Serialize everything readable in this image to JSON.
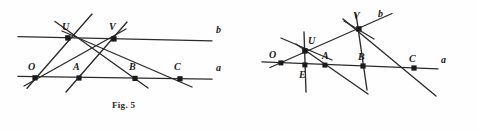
{
  "sheet": {
    "background_color": "#fefefe",
    "ink_color": "#2b2b2b"
  },
  "figures": [
    {
      "id": "fig5",
      "caption": "Fig. 5",
      "line_labels": [
        {
          "name": "b",
          "text": "b",
          "x": 216,
          "y": 25
        },
        {
          "name": "a",
          "text": "a",
          "x": 216,
          "y": 63
        }
      ],
      "points": [
        {
          "name": "U",
          "text": "U",
          "x": 68,
          "y": 38,
          "label_x": 62,
          "label_y": 22
        },
        {
          "name": "V",
          "text": "V",
          "x": 114,
          "y": 39,
          "label_x": 109,
          "label_y": 22
        },
        {
          "name": "O",
          "text": "O",
          "x": 35,
          "y": 78,
          "label_x": 28,
          "label_y": 62
        },
        {
          "name": "A",
          "text": "A",
          "x": 79,
          "y": 78,
          "label_x": 73,
          "label_y": 62
        },
        {
          "name": "B",
          "text": "B",
          "x": 135,
          "y": 78,
          "label_x": 129,
          "label_y": 62
        },
        {
          "name": "C",
          "text": "C",
          "x": 180,
          "y": 78,
          "label_x": 174,
          "label_y": 62
        }
      ]
    },
    {
      "id": "fig6",
      "caption": "Fig. 6",
      "line_labels": [
        {
          "name": "b",
          "text": "b",
          "x": 138,
          "y": 9
        },
        {
          "name": "a",
          "text": "a",
          "x": 201,
          "y": 55
        }
      ],
      "points": [
        {
          "name": "V",
          "text": "V",
          "x": 119,
          "y": 29,
          "label_x": 113,
          "label_y": 11
        },
        {
          "name": "U",
          "text": "U",
          "x": 65,
          "y": 51,
          "label_x": 68,
          "label_y": 36
        },
        {
          "name": "O",
          "text": "O",
          "x": 41,
          "y": 63,
          "label_x": 29,
          "label_y": 50
        },
        {
          "name": "E",
          "text": "E",
          "x": 65,
          "y": 65,
          "label_x": 59,
          "label_y": 70
        },
        {
          "name": "A",
          "text": "A",
          "x": 85,
          "y": 65,
          "label_x": 82,
          "label_y": 51
        },
        {
          "name": "B",
          "text": "B",
          "x": 123,
          "y": 66,
          "label_x": 118,
          "label_y": 52
        },
        {
          "name": "C",
          "text": "C",
          "x": 174,
          "y": 68,
          "label_x": 169,
          "label_y": 54
        }
      ]
    }
  ]
}
